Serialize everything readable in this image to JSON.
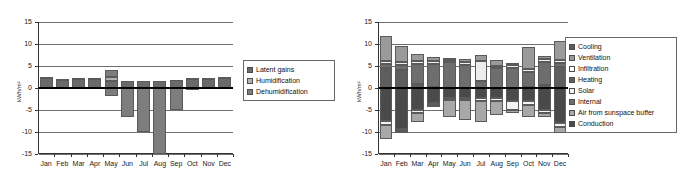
{
  "chart_data": [
    {
      "type": "bar",
      "id": "latent-balance",
      "title": "",
      "xlabel": "",
      "ylabel": "kWh/m²",
      "ylim": [
        -15,
        15
      ],
      "yticks": [
        15,
        10,
        5,
        0,
        -5,
        -10,
        -15
      ],
      "grid": true,
      "stacked": true,
      "legend_position": "right",
      "categories": [
        "Jan",
        "Feb",
        "Mar",
        "Apr",
        "May",
        "Jun",
        "Jul",
        "Aug",
        "Sep",
        "Oct",
        "Nov",
        "Dec"
      ],
      "series": [
        {
          "name": "Latent gains",
          "color": "#6a6a6a",
          "values": [
            2.3,
            1.9,
            2.1,
            2.0,
            1.7,
            1.7,
            1.7,
            1.7,
            1.8,
            2.0,
            2.0,
            2.3
          ]
        },
        {
          "name": "Humidification",
          "color": "#b3b3b3",
          "values": [
            0.3,
            0.2,
            0.2,
            0.2,
            0.8,
            0.0,
            0.0,
            0.0,
            0.0,
            0.2,
            0.2,
            0.3
          ]
        },
        {
          "name": "Dehumidification",
          "color": "#7d7d7d",
          "values": [
            0.0,
            0.0,
            0.0,
            0.0,
            1.6,
            0.0,
            0.0,
            0.0,
            0.0,
            0.0,
            0.0,
            0.0
          ]
        },
        {
          "name": "Dehumidification (negative)",
          "color": "#7d7d7d",
          "values": [
            0.0,
            0.0,
            0.0,
            0.0,
            -1.9,
            -6.6,
            -10.1,
            -15.0,
            -5.1,
            -0.5,
            0.0,
            0.0
          ]
        }
      ],
      "legend": [
        "Latent gains",
        "Humidification",
        "Dehumidification"
      ]
    },
    {
      "type": "bar",
      "id": "energy-balance",
      "title": "",
      "xlabel": "",
      "ylabel": "kWh/m²",
      "ylim": [
        -15,
        15
      ],
      "yticks": [
        15,
        10,
        5,
        0,
        -5,
        -10,
        -15
      ],
      "grid": true,
      "stacked": true,
      "legend_position": "right",
      "categories": [
        "Jan",
        "Feb",
        "Mar",
        "Apr",
        "May",
        "Jun",
        "Jul",
        "Aug",
        "Sep",
        "Oct",
        "Nov",
        "Dec"
      ],
      "series": [
        {
          "name": "Heating",
          "color": "#5e5e5e",
          "values": [
            4.5,
            4.2,
            1.0,
            0.3,
            0.0,
            0.0,
            0.0,
            0.0,
            0.0,
            0.2,
            0.6,
            4.7
          ]
        },
        {
          "name": "Internal",
          "color": "#6e6e6e",
          "values": [
            0.9,
            1.0,
            4.4,
            5.2,
            5.8,
            5.2,
            1.5,
            4.5,
            4.6,
            3.4,
            5.3,
            1.0
          ]
        },
        {
          "name": "Solar",
          "color": "#ededed",
          "values": [
            0.7,
            0.8,
            0.7,
            0.6,
            0.6,
            0.6,
            4.6,
            0.6,
            0.7,
            0.8,
            0.7,
            0.7
          ]
        },
        {
          "name": "Ventilation",
          "color": "#9a9a9a",
          "values": [
            5.7,
            3.6,
            1.7,
            1.0,
            0.4,
            0.9,
            1.3,
            1.3,
            0.3,
            5.0,
            0.6,
            4.2
          ]
        },
        {
          "name": "Conduction",
          "color": "#4a4a4a",
          "values": [
            -7.6,
            -9.4,
            -5.0,
            -3.3,
            -2.2,
            -2.2,
            -2.3,
            -2.3,
            -3.0,
            -3.0,
            -5.1,
            -7.9
          ]
        },
        {
          "name": "Infiltration",
          "color": "#f4f4f4",
          "values": [
            -0.9,
            -0.4,
            -0.6,
            -0.6,
            -0.6,
            -0.6,
            -0.6,
            -0.6,
            -1.9,
            -0.9,
            -0.6,
            -0.9
          ]
        },
        {
          "name": "Air from sunspace buffer",
          "color": "#a8a8a8",
          "values": [
            -3.0,
            -0.3,
            -2.2,
            -0.4,
            -3.7,
            -4.4,
            -4.8,
            -3.3,
            -0.7,
            -2.7,
            -0.9,
            -1.5
          ]
        },
        {
          "name": "Cooling",
          "color": "#5a5a5a",
          "values": [
            0.0,
            0.0,
            0.0,
            0.0,
            0.0,
            0.0,
            0.0,
            0.0,
            0.0,
            0.0,
            0.0,
            0.0
          ]
        }
      ],
      "legend": [
        "Cooling",
        "Ventilation",
        "Infiltration",
        "Heating",
        "Solar",
        "Internal",
        "Air from sunspace buffer",
        "Conduction"
      ],
      "legend_colors": [
        "#5a5a5a",
        "#9a9a9a",
        "#fbfbfb",
        "#5e5e5e",
        "#f2f2f2",
        "#6e6e6e",
        "#a8a8a8",
        "#4a4a4a"
      ]
    }
  ]
}
